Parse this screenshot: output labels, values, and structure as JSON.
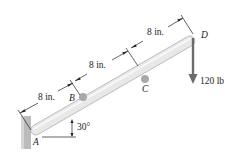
{
  "diagram": {
    "points": {
      "A": "A",
      "B": "B",
      "C": "C",
      "D": "D"
    },
    "dimensions": [
      "8 in.",
      "8 in.",
      "8 in."
    ],
    "force": "120 lb",
    "angle": "30°",
    "colors": {
      "beam_fill": "#e6e6e6",
      "beam_stroke": "#b8b8b8",
      "wall": "#b9b9b9",
      "pin": "#a8a8a8",
      "arrow": "#6b6b6b"
    }
  }
}
